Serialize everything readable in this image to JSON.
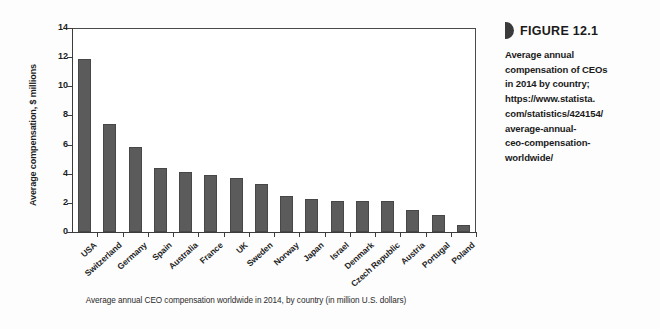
{
  "sidebar": {
    "marker_icon": "half-disc-marker-icon",
    "figure_number": "FIGURE 12.1",
    "description_lines": [
      "Average annual",
      "compensation of CEOs",
      "in 2014 by country;",
      "https://www.statista.",
      "com/statistics/424154/",
      "average-annual-",
      "ceo-compensation-",
      "worldwide/"
    ]
  },
  "chart_caption": "Average annual CEO compensation worldwide in 2014, by country (in million U.S. dollars)",
  "colors": {
    "bar_fill": "#5b5b5b",
    "bar_edge": "#474747",
    "axis": "#3c3c3c",
    "text": "#1d1d1d",
    "background": "#ffffff"
  },
  "chart_data": {
    "type": "bar",
    "title": "",
    "xlabel": "",
    "ylabel": "Average compensation, $ millions",
    "ylim": [
      0,
      14
    ],
    "yticks": [
      0,
      2,
      4,
      6,
      8,
      10,
      12,
      14
    ],
    "grid": false,
    "legend": "none",
    "categories": [
      "USA",
      "Switzerland",
      "Germany",
      "Spain",
      "Australia",
      "France",
      "UK",
      "Sweden",
      "Norway",
      "Japan",
      "Israel",
      "Denmark",
      "Czech Republic",
      "Austria",
      "Portugal",
      "Poland"
    ],
    "values": [
      11.9,
      7.4,
      5.85,
      4.4,
      4.15,
      3.9,
      3.7,
      3.3,
      2.5,
      2.25,
      2.1,
      2.1,
      2.1,
      1.5,
      1.15,
      0.5
    ]
  }
}
